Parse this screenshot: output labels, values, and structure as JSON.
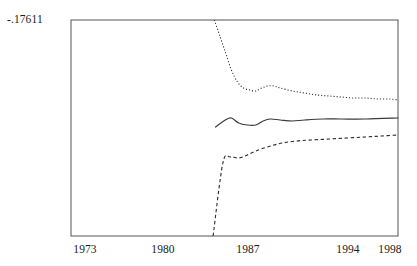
{
  "chart_data": {
    "type": "line",
    "title": "",
    "xlabel": "",
    "ylabel": "",
    "xlim": [
      1972.0,
      1999.0
    ],
    "ylim_note": "Only one y-axis value is printed on the figure: -.17611 at the top of the plot frame. No other y tick labels or gridlines are shown.",
    "y_axis_ticks": [
      "-.17611"
    ],
    "x_axis_ticks": [
      "1973",
      "1980",
      "1987",
      "1994",
      "1998"
    ],
    "x_tick_values": [
      1973,
      1980,
      1987,
      1994,
      1998
    ],
    "grid": false,
    "legend": "none",
    "series": [
      {
        "name": "upper-band",
        "style": "dotted",
        "color": "#2b2b2b",
        "x": [
          1983.6,
          1984.0,
          1984.5,
          1985.0,
          1985.5,
          1986.0,
          1986.5,
          1987.0,
          1987.5,
          1988.0,
          1988.5,
          1989.0,
          1990.0,
          1991.0,
          1992.0,
          1993.0,
          1994.0,
          1995.0,
          1996.0,
          1997.0,
          1998.0,
          1998.9
        ],
        "y_px": [
          20,
          34,
          52,
          70,
          82,
          88,
          90,
          91,
          88,
          86,
          86,
          88,
          91,
          93,
          95,
          96,
          97,
          98,
          98,
          99,
          99,
          100
        ]
      },
      {
        "name": "point-estimate",
        "style": "solid",
        "color": "#3a3a3a",
        "x": [
          1983.7,
          1984.5,
          1985.0,
          1985.6,
          1986.3,
          1987.0,
          1987.6,
          1988.2,
          1989.0,
          1990.0,
          1991.0,
          1992.5,
          1994.0,
          1996.0,
          1998.9
        ],
        "y_px": [
          127,
          120,
          118,
          123,
          125,
          125,
          121,
          119,
          120,
          121,
          120,
          119,
          119,
          119,
          118
        ]
      },
      {
        "name": "lower-band",
        "style": "dashed",
        "color": "#2b2b2b",
        "x": [
          1983.5,
          1984.3,
          1984.9,
          1985.6,
          1986.3,
          1987.2,
          1988.2,
          1989.2,
          1990.3,
          1991.5,
          1993.0,
          1994.5,
          1996.0,
          1997.3,
          1998.9
        ],
        "y_px": [
          236,
          163,
          157,
          158,
          155,
          150,
          146,
          143,
          141,
          140,
          139,
          138,
          137,
          136,
          135
        ]
      }
    ]
  },
  "frame": {
    "left_px": 71,
    "top_px": 20,
    "right_px": 398,
    "bottom_px": 236,
    "border_color": "#555555"
  }
}
